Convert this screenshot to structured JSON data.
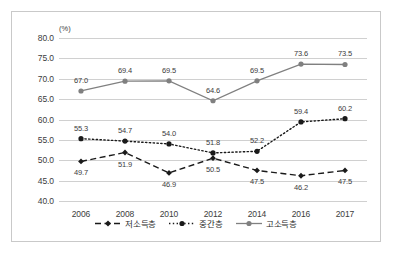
{
  "chart_data": {
    "type": "line",
    "title": "",
    "xlabel": "",
    "ylabel": "",
    "unit_label": "(%)",
    "categories": [
      "2006",
      "2008",
      "2010",
      "2012",
      "2014",
      "2016",
      "2017"
    ],
    "ylim": [
      40.0,
      80.0
    ],
    "ytick_step": 5.0,
    "ytick_labels": [
      "80.0",
      "75.0",
      "70.0",
      "65.0",
      "60.0",
      "55.0",
      "50.0",
      "45.0",
      "40.0"
    ],
    "ytick_values": [
      80.0,
      75.0,
      70.0,
      65.0,
      60.0,
      55.0,
      50.0,
      45.0,
      40.0
    ],
    "grid": true,
    "legend_position": "bottom",
    "series": [
      {
        "name": "저소득층",
        "line_style": "dashed",
        "marker": "diamond",
        "color": "#1a1a1a",
        "values": [
          49.7,
          51.9,
          46.9,
          50.5,
          47.5,
          46.2,
          47.5
        ],
        "label_positions": [
          "below",
          "below",
          "below",
          "below",
          "below",
          "below",
          "below"
        ]
      },
      {
        "name": "중간층",
        "line_style": "dotted",
        "marker": "circle",
        "color": "#1a1a1a",
        "values": [
          55.3,
          54.7,
          54.0,
          51.8,
          52.2,
          59.4,
          60.2
        ],
        "label_positions": [
          "above",
          "above",
          "above",
          "above",
          "above",
          "above",
          "above"
        ]
      },
      {
        "name": "고소득층",
        "line_style": "solid",
        "marker": "circle",
        "color": "#808080",
        "values": [
          67.0,
          69.4,
          69.5,
          64.6,
          69.5,
          73.6,
          73.5
        ],
        "label_positions": [
          "above",
          "above",
          "above",
          "above",
          "above",
          "above",
          "above"
        ]
      }
    ]
  },
  "colors": {
    "grid": "#d0d0d0",
    "frame": "#c9c9c9",
    "text": "#3c3c3c",
    "low_income": "#1a1a1a",
    "middle_income": "#1a1a1a",
    "high_income": "#808080"
  }
}
